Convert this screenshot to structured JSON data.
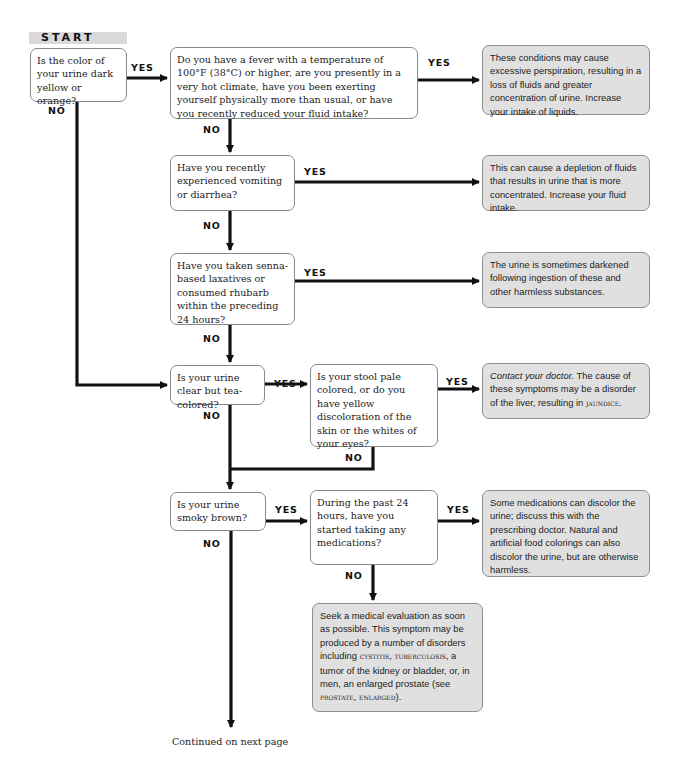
{
  "flowchart": {
    "start_label": "START",
    "yes_label": "YES",
    "no_label": "NO",
    "questions": {
      "q1": "Is the color of your urine dark yellow or orange?",
      "q2": "Do you have a fever with a temperature of 100°F (38°C) or higher, are you presently in a very hot climate, have you been exerting yourself physically more than usual, or have you recently reduced your fluid intake?",
      "q3": "Have you recently experienced vomiting or diarrhea?",
      "q4": "Have you taken senna-based laxatives or consumed rhubarb within the preceding 24 hours?",
      "q5": "Is your urine clear but tea-colored?",
      "q6": "Is your stool pale colored, or do you have yellow discoloration of the skin or the whites of your eyes?",
      "q7": "Is your urine smoky brown?",
      "q8": "During the past 24 hours, have you started taking any medications?"
    },
    "results": {
      "r1": "These conditions may cause excessive perspiration, resulting in a loss of fluids and greater concentration of urine. Increase your intake of liquids.",
      "r2": "This can cause a depletion of fluids that results in urine that is more concentrated. Increase your fluid intake.",
      "r3": "The urine is sometimes darkened following ingestion of these and other harmless substances.",
      "r4": {
        "emphasis": "Contact your doctor.",
        "text": " The cause of these symptoms may be a disorder of the liver, resulting in ",
        "link": "jaundice",
        "end": "."
      },
      "r5": "Some medications can discolor the urine; discuss this with the prescribing doctor. Natural and artificial food colorings can also discolor the urine, but are otherwise harmless.",
      "r6": {
        "text1": "Seek a medical evaluation as soon as possible. This symptom may be produced by a number of disorders including ",
        "link1": "cystitis",
        "sep1": ", ",
        "link2": "tuberculosis",
        "text2": ", a tumor of the kidney or bladder, or, in men, an enlarged prostate (see ",
        "link3": "prostate, enlarged",
        "text3": ")."
      }
    },
    "continued": "Continued on next page",
    "colors": {
      "question_bg": "#ffffff",
      "result_bg": "#e0e0e0",
      "line": "#111111",
      "start_bg": "#d9d9d9"
    }
  }
}
